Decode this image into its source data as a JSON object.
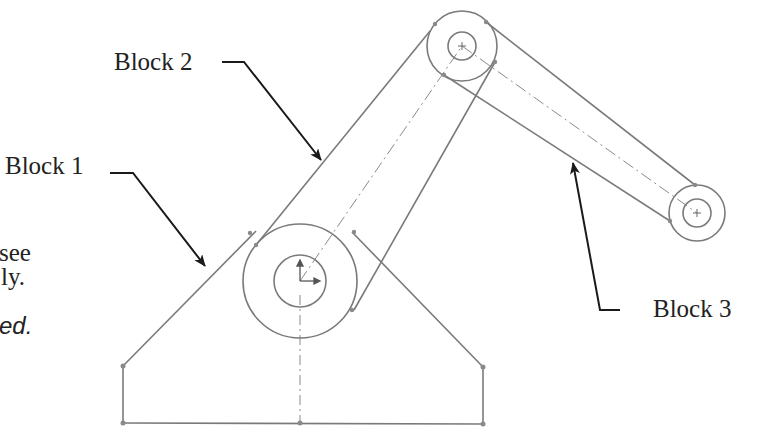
{
  "labels": {
    "block1": "Block 1",
    "block2": "Block 2",
    "block3": "Block 3"
  },
  "cropped_text": {
    "line1": "see",
    "line2": "ly.",
    "line3": "ed."
  },
  "colors": {
    "sketch_line": "#7a7a7a",
    "leader": "#1a1a1a",
    "text": "#222222",
    "background": "#ffffff"
  }
}
